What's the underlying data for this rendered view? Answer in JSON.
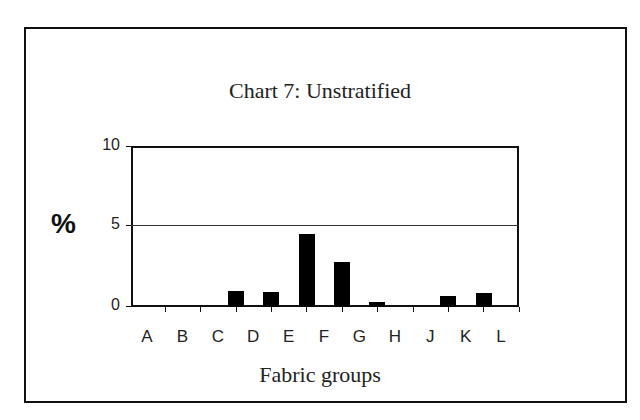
{
  "chart_data": {
    "type": "bar",
    "title": "Chart 7: Unstratified",
    "xlabel": "Fabric groups",
    "ylabel": "%",
    "categories": [
      "A",
      "B",
      "C",
      "D",
      "E",
      "F",
      "G",
      "H",
      "J",
      "K",
      "L"
    ],
    "values": [
      0,
      0,
      1.0,
      0.9,
      4.5,
      2.8,
      0.3,
      0,
      0.7,
      0.85,
      0
    ],
    "ylim": [
      0,
      10
    ],
    "yticks": [
      "0",
      "5",
      "10"
    ],
    "grid": "horizontal line at 5",
    "legend": "none",
    "bar_color": "#000000"
  }
}
